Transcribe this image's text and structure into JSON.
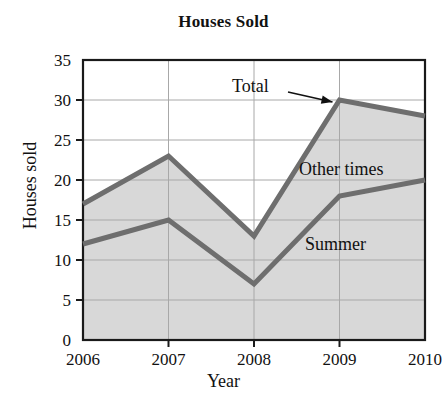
{
  "chart_data": {
    "type": "area",
    "title": "Houses Sold",
    "xlabel": "Year",
    "ylabel": "Houses sold",
    "categories": [
      "2006",
      "2007",
      "2008",
      "2009",
      "2010"
    ],
    "x": [
      2006,
      2007,
      2008,
      2009,
      2010
    ],
    "series": [
      {
        "name": "Summer",
        "values": [
          12,
          15,
          7,
          18,
          20
        ]
      },
      {
        "name": "Total",
        "values": [
          17,
          23,
          13,
          30,
          28
        ]
      }
    ],
    "ylim": [
      0,
      35
    ],
    "yticks": [
      0,
      5,
      10,
      15,
      20,
      25,
      30,
      35
    ],
    "ytick_labels": [
      "0",
      "5",
      "10",
      "15",
      "20",
      "25",
      "30",
      "35"
    ],
    "xlim": [
      2006,
      2010
    ],
    "grid": "both",
    "legend": "none",
    "annotations": [
      {
        "text": "Total",
        "kind": "arrow-callout",
        "points_to": "2009 total peak (30)"
      },
      {
        "text": "Other times",
        "kind": "band-label",
        "band": "between Summer and Total"
      },
      {
        "text": "Summer",
        "kind": "band-label",
        "band": "below Summer line"
      }
    ],
    "colors": {
      "line": "#6e6e6e",
      "fill_lower": "#d8d8d8",
      "fill_upper": "#d8d8d8",
      "grid": "#a8a8a8",
      "axis": "#1a1a1a",
      "text": "#111111",
      "background": "#ffffff"
    }
  }
}
